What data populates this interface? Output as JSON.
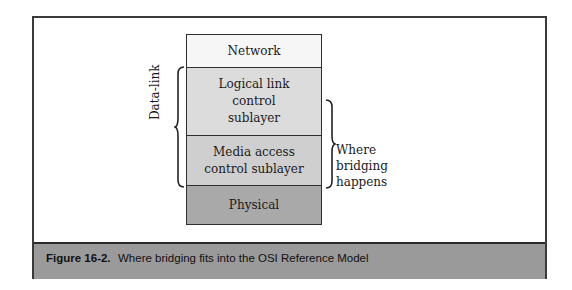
{
  "diagram": {
    "layers": [
      {
        "label": "Network"
      },
      {
        "label": "Logical link control sublayer"
      },
      {
        "label": "Media access control sublayer"
      },
      {
        "label": "Physical"
      }
    ],
    "left_brace_label": "Data-link",
    "right_brace_label": "Where bridging happens"
  },
  "caption": {
    "number": "Figure 16-2.",
    "text": "Where bridging fits into the OSI Reference Model"
  },
  "colors": {
    "network": "#f6f6f6",
    "llc": "#dcdcdc",
    "mac": "#cfcfcf",
    "physical": "#a9a9a9",
    "caption_band": "#9a9a9a"
  }
}
